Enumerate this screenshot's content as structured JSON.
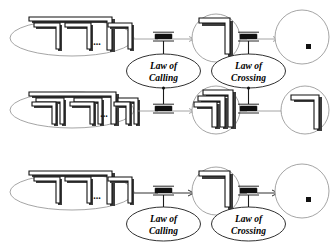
{
  "diagram": {
    "background_color": "#ffffff",
    "ink_color": "#111111",
    "outline_color": "#8e8e8e",
    "ellipsis_text": "...",
    "labels": {
      "law_of_calling_line1": "Law of",
      "law_of_calling_line2": "Calling",
      "law_of_crossing_line1": "Law of",
      "law_of_crossing_line2": "Crossing"
    },
    "rows": [
      {
        "id": "row-1",
        "source": {
          "shape": "ellipse",
          "corner_count": 3,
          "has_ellipsis": true,
          "outer_frame": true
        },
        "transition_1": {
          "label_line1": "Law of",
          "label_line2": "Calling"
        },
        "middle": {
          "shape": "circle",
          "corner_count": 1
        },
        "transition_2": {
          "label_line1": "Law of",
          "label_line2": "Crossing"
        },
        "target": {
          "shape": "circle",
          "corner_count": 0,
          "has_token_square": true
        }
      },
      {
        "id": "row-2",
        "source": {
          "shape": "ellipse",
          "corner_count": 3,
          "has_ellipsis": true,
          "outer_frame": true
        },
        "transition_1": {
          "label_line1": "Law of",
          "label_line2": "Calling"
        },
        "middle": {
          "shape": "circle",
          "corner_count": 3
        },
        "transition_2": {
          "label_line1": "Law of",
          "label_line2": "Crossing"
        },
        "target": {
          "shape": "circle",
          "corner_count": 1,
          "has_token_square": false
        }
      },
      {
        "id": "row-3",
        "source": {
          "shape": "ellipse",
          "corner_count": 3,
          "has_ellipsis": true,
          "outer_frame": true
        },
        "transition_1": {
          "label_line1": "Law of",
          "label_line2": "Calling"
        },
        "middle": {
          "shape": "circle",
          "corner_count": 1
        },
        "transition_2": {
          "label_line1": "Law of",
          "label_line2": "Crossing"
        },
        "target": {
          "shape": "circle",
          "corner_count": 0,
          "has_token_square": true
        }
      }
    ]
  }
}
